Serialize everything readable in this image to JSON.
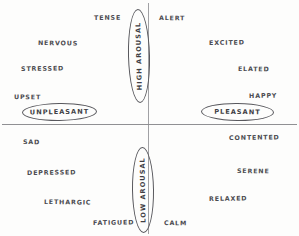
{
  "diagram": {
    "background_color": "#fdfdfc",
    "ink_color": "#4b4b50",
    "axes": {
      "horizontal_label": "valence",
      "vertical_label": "arousal"
    }
  },
  "axis_poles": {
    "high_arousal": "HIGH AROUSAL",
    "low_arousal": "LOW AROUSAL",
    "unpleasant": "UNPLEASANT",
    "pleasant": "PLEASANT"
  },
  "quadrants": {
    "upper_left": {
      "name": "high arousal / unpleasant",
      "words": [
        "TENSE",
        "NERVOUS",
        "STRESSED",
        "UPSET"
      ]
    },
    "upper_right": {
      "name": "high arousal / pleasant",
      "words": [
        "ALERT",
        "EXCITED",
        "ELATED",
        "HAPPY"
      ]
    },
    "lower_left": {
      "name": "low arousal / unpleasant",
      "words": [
        "SAD",
        "DEPRESSED",
        "LETHARGIC",
        "FATIGUED"
      ]
    },
    "lower_right": {
      "name": "low arousal / pleasant",
      "words": [
        "CONTENTED",
        "SERENE",
        "RELAXED",
        "CALM"
      ]
    }
  },
  "words": {
    "tense": "TENSE",
    "alert": "ALERT",
    "nervous": "NERVOUS",
    "excited": "EXCITED",
    "stressed": "STRESSED",
    "elated": "ELATED",
    "upset": "UPSET",
    "happy": "HAPPY",
    "sad": "SAD",
    "contented": "CONTENTED",
    "depressed": "DEPRESSED",
    "serene": "SERENE",
    "lethargic": "LETHARGIC",
    "relaxed": "RELAXED",
    "fatigued": "FATIGUED",
    "calm": "CALM"
  }
}
